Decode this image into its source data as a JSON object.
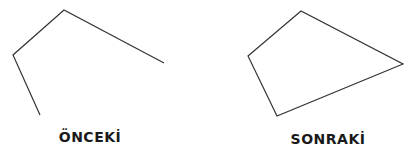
{
  "panels": [
    {
      "label": "ÖNCEKİ",
      "shape": "open-polyline",
      "points": [
        [
          40,
          115
        ],
        [
          13,
          55
        ],
        [
          64,
          10
        ],
        [
          164,
          63
        ]
      ]
    },
    {
      "label": "SONRAKİ",
      "shape": "closed-polygon",
      "points": [
        [
          248,
          56
        ],
        [
          301,
          11
        ],
        [
          403,
          64
        ],
        [
          277,
          116
        ]
      ]
    }
  ],
  "colors": {
    "stroke": "#333333",
    "text": "#1a1a1a",
    "background": "#ffffff"
  }
}
